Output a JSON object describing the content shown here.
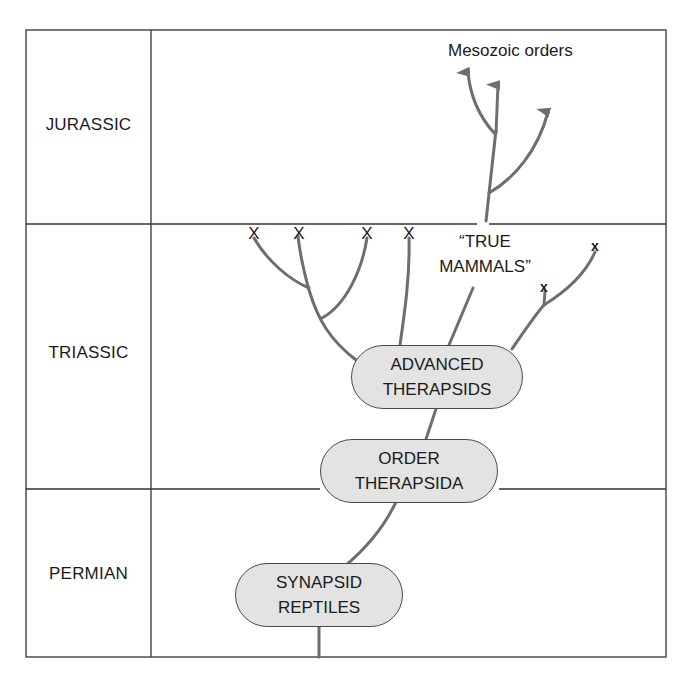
{
  "periods": [
    {
      "name": "JURASSIC"
    },
    {
      "name": "TRIASSIC"
    },
    {
      "name": "PERMIAN"
    }
  ],
  "nodes": {
    "synapsid": {
      "line1": "SYNAPSID",
      "line2": "REPTILES"
    },
    "order": {
      "line1": "ORDER",
      "line2": "THERAPSIDA"
    },
    "advanced": {
      "line1": "ADVANCED",
      "line2": "THERAPSIDS"
    }
  },
  "labels": {
    "true_mammals_line1": "“TRUE",
    "true_mammals_line2": "MAMMALS”",
    "mesozoic": "Mesozoic orders"
  },
  "extinction_marker": "X",
  "extinction_marker_small": "x",
  "colors": {
    "branch_line": "#6e6e6e",
    "frame_line": "#333333",
    "node_fill": "#e3e3e3",
    "node_border": "#4a4a4a",
    "text": "#1a1a1a"
  }
}
